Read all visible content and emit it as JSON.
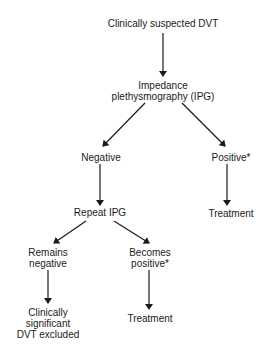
{
  "diagram": {
    "title": "",
    "colors": {
      "text": "#1a1a1a",
      "line": "#1a1a1a",
      "background": "#ffffff"
    },
    "nodes": [
      {
        "id": "start",
        "lines": [
          "Clinically suspected DVT"
        ],
        "x": 163,
        "y": 18
      },
      {
        "id": "ipg",
        "lines": [
          "Impedance",
          "plethysmography (IPG)"
        ],
        "x": 163,
        "y": 80
      },
      {
        "id": "negative",
        "lines": [
          "Negative"
        ],
        "x": 101,
        "y": 152
      },
      {
        "id": "positive",
        "lines": [
          "Positive*"
        ],
        "x": 231,
        "y": 152
      },
      {
        "id": "repeat",
        "lines": [
          "Repeat IPG"
        ],
        "x": 100,
        "y": 207
      },
      {
        "id": "treatment1",
        "lines": [
          "Treatment"
        ],
        "x": 231,
        "y": 208
      },
      {
        "id": "remains",
        "lines": [
          "Remains",
          "negative"
        ],
        "x": 48,
        "y": 247
      },
      {
        "id": "becomes",
        "lines": [
          "Becomes",
          "positive*"
        ],
        "x": 150,
        "y": 247
      },
      {
        "id": "excluded",
        "lines": [
          "Clinically",
          "significant",
          "DVT excluded"
        ],
        "x": 48,
        "y": 307
      },
      {
        "id": "treatment2",
        "lines": [
          "Treatment"
        ],
        "x": 150,
        "y": 313
      }
    ],
    "edges": [
      {
        "from": "start",
        "to": "ipg",
        "x1": 163,
        "y1": 33,
        "x2": 163,
        "y2": 76
      },
      {
        "from": "ipg",
        "to": "negative",
        "x1": 145,
        "y1": 103,
        "x2": 103,
        "y2": 146
      },
      {
        "from": "ipg",
        "to": "positive",
        "x1": 182,
        "y1": 103,
        "x2": 225,
        "y2": 146
      },
      {
        "from": "negative",
        "to": "repeat",
        "x1": 100,
        "y1": 164,
        "x2": 100,
        "y2": 205
      },
      {
        "from": "positive",
        "to": "treatment1",
        "x1": 227,
        "y1": 164,
        "x2": 227,
        "y2": 205
      },
      {
        "from": "repeat",
        "to": "remains",
        "x1": 86,
        "y1": 221,
        "x2": 54,
        "y2": 243
      },
      {
        "from": "repeat",
        "to": "becomes",
        "x1": 114,
        "y1": 221,
        "x2": 149,
        "y2": 243
      },
      {
        "from": "remains",
        "to": "excluded",
        "x1": 48,
        "y1": 270,
        "x2": 48,
        "y2": 303
      },
      {
        "from": "becomes",
        "to": "treatment2",
        "x1": 149,
        "y1": 270,
        "x2": 149,
        "y2": 309
      }
    ]
  }
}
